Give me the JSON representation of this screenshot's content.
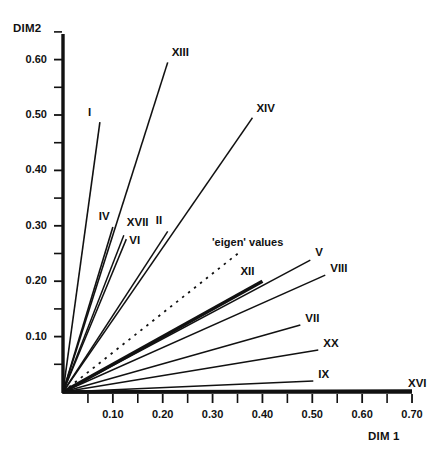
{
  "chart_data": {
    "type": "line",
    "title": "",
    "subtitle": "",
    "xlabel": "DIM 1",
    "ylabel": "DIM2",
    "xlim": [
      0.0,
      0.72
    ],
    "ylim": [
      0.0,
      0.68
    ],
    "xticks": [
      0.1,
      0.2,
      0.3,
      0.4,
      0.5,
      0.6,
      0.7
    ],
    "xtick_labels": [
      "0.10",
      "0.20",
      "0.30",
      "0.40",
      "0.50",
      "0.60",
      "0.70"
    ],
    "xminor_ticks": [
      0.05,
      0.15,
      0.25,
      0.35,
      0.45,
      0.55,
      0.65
    ],
    "yticks": [
      0.1,
      0.2,
      0.3,
      0.4,
      0.5,
      0.6
    ],
    "ytick_labels": [
      "0.10",
      "0.20",
      "0.30",
      "0.40",
      "0.50",
      "0.60"
    ],
    "yminor_ticks": [
      0.05,
      0.15,
      0.25,
      0.35,
      0.45,
      0.55,
      0.65
    ],
    "grid": false,
    "legend_position": "none",
    "origin": [
      0.0,
      0.0
    ],
    "series": [
      {
        "name": "XIII",
        "x": 0.21,
        "y": 0.595,
        "style": "solid",
        "width": 1.6,
        "label_dx": 4,
        "label_dy": -16
      },
      {
        "name": "XIV",
        "x": 0.38,
        "y": 0.495,
        "style": "solid",
        "width": 1.4,
        "label_dx": 4,
        "label_dy": -16
      },
      {
        "name": "I",
        "x": 0.074,
        "y": 0.487,
        "style": "solid",
        "width": 1.6,
        "label_dx": -12,
        "label_dy": -16
      },
      {
        "name": "IV",
        "x": 0.1,
        "y": 0.298,
        "style": "solid",
        "width": 1.6,
        "label_dx": -14,
        "label_dy": -17
      },
      {
        "name": "XVII",
        "x": 0.122,
        "y": 0.283,
        "style": "solid",
        "width": 1.5,
        "label_dx": 3,
        "label_dy": -19
      },
      {
        "name": "VI",
        "x": 0.127,
        "y": 0.276,
        "style": "solid",
        "width": 1.5,
        "label_dx": 3,
        "label_dy": -5
      },
      {
        "name": "II",
        "x": 0.21,
        "y": 0.29,
        "style": "solid",
        "width": 1.5,
        "label_dx": -12,
        "label_dy": -17
      },
      {
        "name": "V",
        "x": 0.496,
        "y": 0.238,
        "style": "solid",
        "width": 1.5,
        "label_dx": 5,
        "label_dy": -14
      },
      {
        "name": "VIII",
        "x": 0.526,
        "y": 0.211,
        "style": "solid",
        "width": 1.5,
        "label_dx": 5,
        "label_dy": -13
      },
      {
        "name": "XII",
        "x": 0.4,
        "y": 0.2,
        "style": "solid",
        "width": 3.6,
        "label_dx": -22,
        "label_dy": -16
      },
      {
        "name": "VII",
        "x": 0.476,
        "y": 0.121,
        "style": "solid",
        "width": 1.5,
        "label_dx": 5,
        "label_dy": -13
      },
      {
        "name": "XX",
        "x": 0.512,
        "y": 0.076,
        "style": "solid",
        "width": 1.5,
        "label_dx": 5,
        "label_dy": -13
      },
      {
        "name": "IX",
        "x": 0.502,
        "y": 0.02,
        "style": "solid",
        "width": 1.5,
        "label_dx": 5,
        "label_dy": -13
      },
      {
        "name": "XVI",
        "x": 0.7,
        "y": 0.002,
        "style": "solid",
        "width": 3.4,
        "label_dx": -4,
        "label_dy": -14
      },
      {
        "name": "'eigen' values",
        "x": 0.355,
        "y": 0.253,
        "style": "dashed",
        "width": 1.8,
        "label_dx": -28,
        "label_dy": -16
      }
    ]
  },
  "annotations": {
    "eigen_values_note": "'eigen' values"
  },
  "colors": {
    "axis": "#111111",
    "line": "#111111",
    "background": "#ffffff",
    "text": "#111111"
  }
}
